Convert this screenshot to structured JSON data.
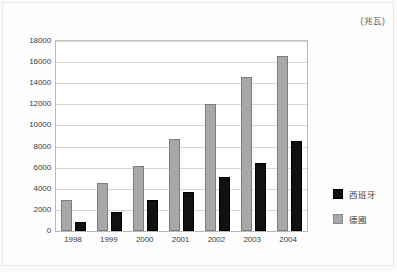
{
  "unit_label": "(兆瓦)",
  "legend": {
    "position": "right",
    "entries": [
      {
        "label": "西班牙",
        "key": "spain",
        "color": "#111111"
      },
      {
        "label": "德國",
        "key": "germany",
        "color": "#a8a8a8"
      }
    ]
  },
  "chart_data": {
    "type": "bar",
    "title": "",
    "subtitle": "",
    "xlabel": "",
    "ylabel": "",
    "unit": "(兆瓦)",
    "grid": true,
    "legend_position": "right",
    "categories": [
      "1998",
      "1999",
      "2000",
      "2001",
      "2002",
      "2003",
      "2004"
    ],
    "ylim": [
      0,
      18000
    ],
    "ytick_step": 2000,
    "ytick_labels": [
      "0",
      "2000",
      "4000",
      "6000",
      "8000",
      "10000",
      "12000",
      "14000",
      "16000",
      "18000"
    ],
    "series": [
      {
        "name": "德國",
        "key": "germany",
        "color": "#a8a8a8",
        "values": [
          2950,
          4550,
          6150,
          8750,
          12000,
          14600,
          16600
        ]
      },
      {
        "name": "西班牙",
        "key": "spain",
        "color": "#111111",
        "values": [
          900,
          1800,
          2950,
          3650,
          5150,
          6450,
          8550
        ]
      }
    ]
  }
}
